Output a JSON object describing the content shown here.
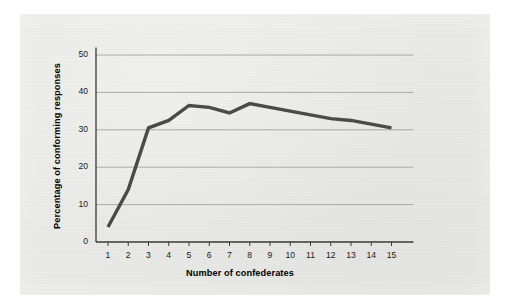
{
  "figure": {
    "panel_background": "#e9e9e7",
    "outer_background": "#ffffff",
    "line_color": "#4a4a4a",
    "grid_color": "#9a9a9a",
    "axis_color": "#3a3a3a"
  },
  "chart_data": {
    "type": "line",
    "title": "",
    "xlabel": "Number of confederates",
    "ylabel": "Percentage of conforming responses",
    "categories": [
      "1",
      "2",
      "3",
      "4",
      "5",
      "6",
      "7",
      "8",
      "9",
      "10",
      "11",
      "12",
      "13",
      "14",
      "15"
    ],
    "x": [
      1,
      2,
      3,
      4,
      5,
      6,
      7,
      8,
      9,
      10,
      11,
      12,
      13,
      14,
      15
    ],
    "values": [
      4,
      14,
      30.5,
      32.5,
      36.5,
      36,
      34.5,
      37,
      36,
      35,
      34,
      33,
      32.5,
      31.5,
      30.5
    ],
    "series": [
      {
        "name": "Percentage of conforming responses",
        "values": [
          4,
          14,
          30.5,
          32.5,
          36.5,
          36,
          34.5,
          37,
          36,
          35,
          34,
          33,
          32.5,
          31.5,
          30.5
        ]
      }
    ],
    "ylim": [
      0,
      52
    ],
    "xlim": [
      0.5,
      15.8
    ],
    "yticks": [
      0,
      10,
      20,
      30,
      40,
      50
    ],
    "ytick_labels": [
      "0",
      "10",
      "20",
      "30",
      "40",
      "50"
    ],
    "xticks": [
      1,
      2,
      3,
      4,
      5,
      6,
      7,
      8,
      9,
      10,
      11,
      12,
      13,
      14,
      15
    ],
    "xtick_labels": [
      "1",
      "2",
      "3",
      "4",
      "5",
      "6",
      "7",
      "8",
      "9",
      "10",
      "11",
      "12",
      "13",
      "14",
      "15"
    ],
    "grid": "horizontal",
    "legend": "none",
    "markers": "none",
    "line_width": 3.4
  }
}
